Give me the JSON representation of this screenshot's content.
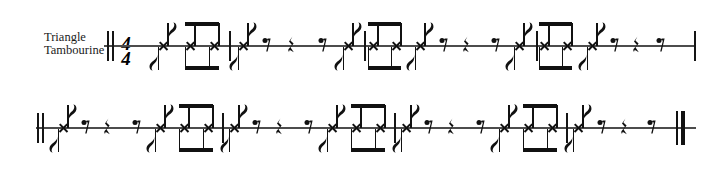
{
  "document": {
    "type": "music-score",
    "notation": "percussion-single-line",
    "systems": 2
  },
  "labels": {
    "part_line1": "Triangle",
    "part_line2": "Tambourine",
    "timp_note": "Timp. Tacet"
  },
  "time_signature": {
    "numerator": "4",
    "denominator": "4"
  },
  "colors": {
    "ink": "#111111",
    "staff": "#4c4c4c",
    "paper": "#ffffff"
  },
  "system1": {
    "staff": {
      "x": 104,
      "y": 46,
      "width": 592
    },
    "start_barline": "double-thin",
    "end_barline": "thin",
    "measures": [
      {
        "index": 1,
        "events": [
          {
            "kind": "note",
            "x": 163,
            "stems": "both",
            "flags": "both",
            "value": "eighth"
          },
          {
            "kind": "note",
            "x": 190,
            "stems": "both",
            "beamed": true,
            "value": "eighth"
          },
          {
            "kind": "note",
            "x": 214,
            "stems": "both",
            "beamed": true,
            "value": "eighth"
          }
        ]
      },
      {
        "index": 2,
        "events": [
          {
            "kind": "note",
            "x": 243,
            "stems": "both",
            "flags": "both",
            "value": "eighth"
          },
          {
            "kind": "rest",
            "x": 266,
            "value": "eighth"
          },
          {
            "kind": "rest",
            "x": 291,
            "value": "quarter"
          },
          {
            "kind": "rest",
            "x": 322,
            "value": "eighth"
          },
          {
            "kind": "note",
            "x": 348,
            "stems": "both",
            "flags": "both",
            "value": "eighth"
          },
          {
            "kind": "note",
            "x": 373,
            "stems": "both",
            "beamed": true,
            "value": "eighth"
          },
          {
            "kind": "note",
            "x": 396,
            "stems": "both",
            "beamed": true,
            "value": "eighth"
          }
        ]
      },
      {
        "index": 3,
        "events": [
          {
            "kind": "note",
            "x": 420,
            "stems": "both",
            "flags": "both",
            "value": "eighth"
          },
          {
            "kind": "rest",
            "x": 443,
            "value": "eighth"
          },
          {
            "kind": "rest",
            "x": 466,
            "value": "quarter"
          },
          {
            "kind": "rest",
            "x": 495,
            "value": "eighth"
          },
          {
            "kind": "note",
            "x": 519,
            "stems": "both",
            "flags": "both",
            "value": "eighth"
          },
          {
            "kind": "note",
            "x": 544,
            "stems": "both",
            "beamed": true,
            "value": "eighth"
          },
          {
            "kind": "note",
            "x": 567,
            "stems": "both",
            "beamed": true,
            "value": "eighth"
          }
        ]
      },
      {
        "index": 4,
        "events": [
          {
            "kind": "note",
            "x": 592,
            "stems": "both",
            "flags": "both",
            "value": "eighth"
          },
          {
            "kind": "rest",
            "x": 614,
            "value": "eighth"
          },
          {
            "kind": "rest",
            "x": 636,
            "value": "quarter"
          },
          {
            "kind": "rest",
            "x": 660,
            "value": "eighth"
          }
        ]
      }
    ],
    "barline_positions": [
      107,
      112,
      229,
      364,
      536,
      694
    ]
  },
  "system2": {
    "staff": {
      "x": 36,
      "y": 128,
      "width": 660
    },
    "start_barline": "double-thin",
    "end_barline": "final-thin-thick",
    "measures": [
      {
        "index": 5,
        "events": [
          {
            "kind": "note",
            "x": 63,
            "stems": "both",
            "flags": "both",
            "value": "eighth"
          },
          {
            "kind": "rest",
            "x": 85,
            "value": "eighth"
          },
          {
            "kind": "rest",
            "x": 107,
            "value": "quarter"
          },
          {
            "kind": "rest",
            "x": 136,
            "value": "eighth"
          },
          {
            "kind": "note",
            "x": 160,
            "stems": "both",
            "flags": "both",
            "value": "eighth"
          },
          {
            "kind": "note",
            "x": 184,
            "stems": "both",
            "beamed": true,
            "value": "eighth"
          },
          {
            "kind": "note",
            "x": 208,
            "stems": "both",
            "beamed": true,
            "value": "eighth"
          }
        ]
      },
      {
        "index": 6,
        "events": [
          {
            "kind": "note",
            "x": 234,
            "stems": "both",
            "flags": "both",
            "value": "eighth"
          },
          {
            "kind": "rest",
            "x": 256,
            "value": "eighth"
          },
          {
            "kind": "rest",
            "x": 279,
            "value": "quarter"
          },
          {
            "kind": "rest",
            "x": 308,
            "value": "eighth"
          },
          {
            "kind": "note",
            "x": 332,
            "stems": "both",
            "flags": "both",
            "value": "eighth"
          },
          {
            "kind": "note",
            "x": 356,
            "stems": "both",
            "beamed": true,
            "value": "eighth"
          },
          {
            "kind": "note",
            "x": 380,
            "stems": "both",
            "beamed": true,
            "value": "eighth"
          }
        ]
      },
      {
        "index": 7,
        "events": [
          {
            "kind": "note",
            "x": 406,
            "stems": "both",
            "flags": "both",
            "value": "eighth"
          },
          {
            "kind": "rest",
            "x": 428,
            "value": "eighth"
          },
          {
            "kind": "rest",
            "x": 451,
            "value": "quarter"
          },
          {
            "kind": "rest",
            "x": 480,
            "value": "eighth"
          },
          {
            "kind": "note",
            "x": 504,
            "stems": "both",
            "flags": "both",
            "value": "eighth"
          },
          {
            "kind": "note",
            "x": 528,
            "stems": "both",
            "beamed": true,
            "value": "eighth"
          },
          {
            "kind": "note",
            "x": 552,
            "stems": "both",
            "beamed": true,
            "value": "eighth"
          }
        ]
      },
      {
        "index": 8,
        "events": [
          {
            "kind": "note",
            "x": 578,
            "stems": "both",
            "flags": "both",
            "value": "eighth"
          },
          {
            "kind": "rest",
            "x": 601,
            "value": "eighth"
          },
          {
            "kind": "rest",
            "x": 624,
            "value": "quarter"
          },
          {
            "kind": "rest",
            "x": 651,
            "value": "eighth"
          }
        ]
      }
    ],
    "barline_positions": [
      37,
      42,
      222,
      394,
      566,
      676
    ]
  }
}
